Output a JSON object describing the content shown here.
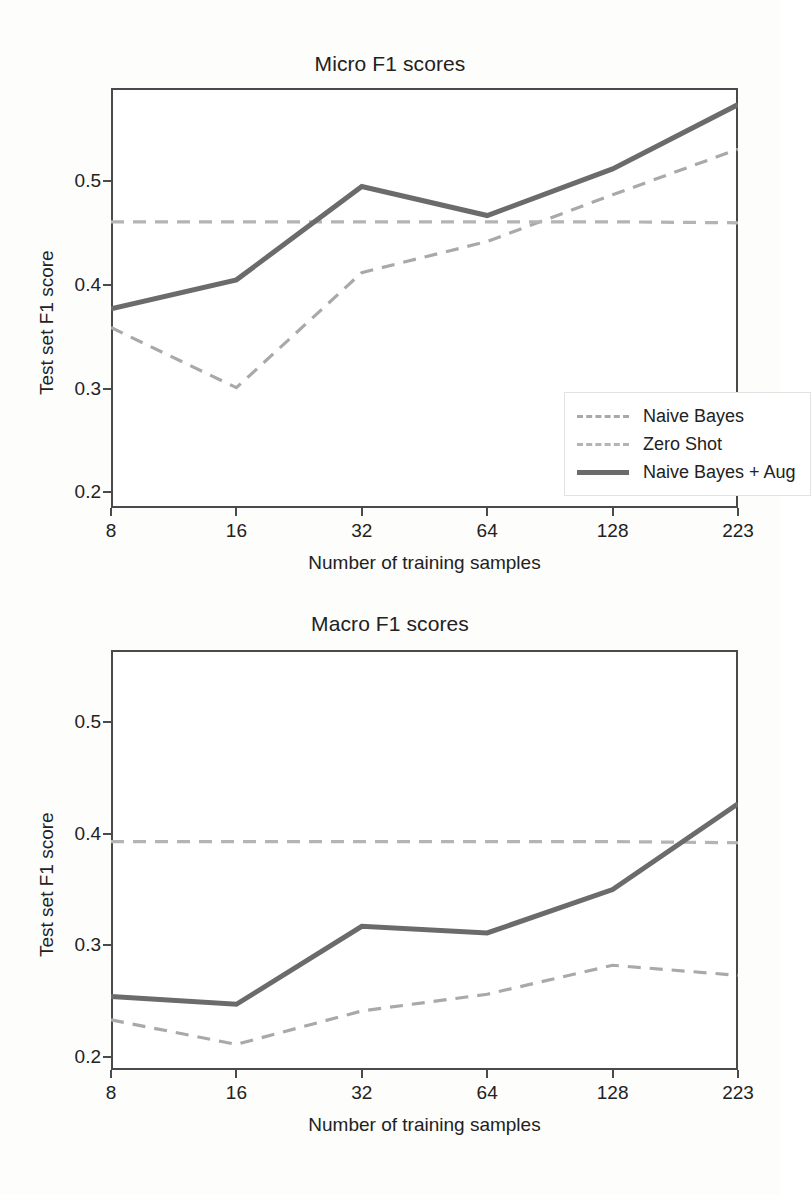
{
  "figures": [
    {
      "id": "micro",
      "title": "Micro F1 scores",
      "xlabel": "Number of training samples",
      "ylabel": "Test set F1 score"
    },
    {
      "id": "macro",
      "title": "Macro F1 scores",
      "xlabel": "Number of training samples",
      "ylabel": "Test set F1 score"
    }
  ],
  "legend": {
    "items": [
      {
        "label": "Naive Bayes",
        "style": "dashed",
        "color": "#a9a9a9"
      },
      {
        "label": "Zero Shot",
        "style": "dashed",
        "color": "#b4b4b4"
      },
      {
        "label": "Naive Bayes + Aug",
        "style": "solid",
        "color": "#6b6b6b"
      }
    ]
  },
  "colors": {
    "solid_line": "#6b6b6b",
    "dashed_naive_bayes": "#a9a9a9",
    "dashed_zero_shot": "#b4b4b4",
    "axis": "#4a4a4a",
    "text": "#222222",
    "background": "#fdfdfc"
  },
  "chart_data": [
    {
      "type": "line",
      "title": "Micro F1 scores",
      "xlabel": "Number of training samples",
      "ylabel": "Test set F1 score",
      "categories": [
        "8",
        "16",
        "32",
        "64",
        "128",
        "223"
      ],
      "xtick_labels": [
        "8",
        "16",
        "32",
        "64",
        "128",
        "223"
      ],
      "ytick_labels": [
        "0.2",
        "0.3",
        "0.4",
        "0.5"
      ],
      "ytick_values": [
        0.2,
        0.3,
        0.4,
        0.5
      ],
      "ylim": [
        0.185,
        0.59
      ],
      "grid": false,
      "legend_position": "lower-right-inside",
      "series": [
        {
          "name": "Naive Bayes",
          "style": "dashed",
          "color": "#a9a9a9",
          "values": [
            0.359,
            0.301,
            0.412,
            0.442,
            0.487,
            0.531
          ]
        },
        {
          "name": "Zero Shot",
          "style": "dashed",
          "color": "#b4b4b4",
          "values": [
            0.461,
            0.461,
            0.461,
            0.461,
            0.461,
            0.46
          ]
        },
        {
          "name": "Naive Bayes + Aug",
          "style": "solid",
          "color": "#6b6b6b",
          "values": [
            0.377,
            0.405,
            0.495,
            0.467,
            0.512,
            0.574
          ]
        }
      ]
    },
    {
      "type": "line",
      "title": "Macro F1 scores",
      "xlabel": "Number of training samples",
      "ylabel": "Test set F1 score",
      "categories": [
        "8",
        "16",
        "32",
        "64",
        "128",
        "223"
      ],
      "xtick_labels": [
        "8",
        "16",
        "32",
        "64",
        "128",
        "223"
      ],
      "ytick_labels": [
        "0.2",
        "0.3",
        "0.4",
        "0.5"
      ],
      "ytick_values": [
        0.2,
        0.3,
        0.4,
        0.5
      ],
      "ylim": [
        0.188,
        0.565
      ],
      "grid": false,
      "legend_position": "none",
      "series": [
        {
          "name": "Naive Bayes",
          "style": "dashed",
          "color": "#a9a9a9",
          "values": [
            0.233,
            0.211,
            0.241,
            0.256,
            0.282,
            0.273
          ]
        },
        {
          "name": "Zero Shot",
          "style": "dashed",
          "color": "#b4b4b4",
          "values": [
            0.393,
            0.393,
            0.393,
            0.393,
            0.393,
            0.392
          ]
        },
        {
          "name": "Naive Bayes + Aug",
          "style": "solid",
          "color": "#6b6b6b",
          "values": [
            0.254,
            0.247,
            0.317,
            0.311,
            0.35,
            0.427
          ]
        }
      ]
    }
  ]
}
